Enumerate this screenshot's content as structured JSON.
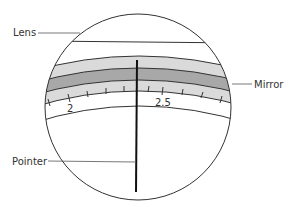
{
  "diagram": {
    "labels": {
      "lens": "Lens",
      "mirror": "Mirror",
      "pointer": "Pointer"
    },
    "scale": {
      "numbers": [
        "2",
        "2.5"
      ]
    },
    "colors": {
      "outline": "#333333",
      "band_light": "#d9d9d9",
      "band_dark": "#a6a6a6",
      "background": "#ffffff"
    }
  }
}
